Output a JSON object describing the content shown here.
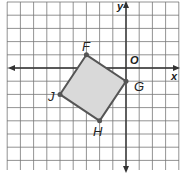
{
  "diagram": {
    "type": "coordinate-plane",
    "axes": {
      "x_label": "x",
      "y_label": "y",
      "origin_label": "O"
    },
    "grid": {
      "x_min": -9,
      "x_max": 4,
      "y_min": -7,
      "y_max": 5
    },
    "polygon": {
      "fill": "#d9d9d9",
      "stroke": "#555555",
      "vertices": [
        {
          "name": "F",
          "x": -3,
          "y": 1
        },
        {
          "name": "G",
          "x": 0,
          "y": -1
        },
        {
          "name": "H",
          "x": -2,
          "y": -4
        },
        {
          "name": "J",
          "x": -5,
          "y": -2
        }
      ]
    }
  }
}
